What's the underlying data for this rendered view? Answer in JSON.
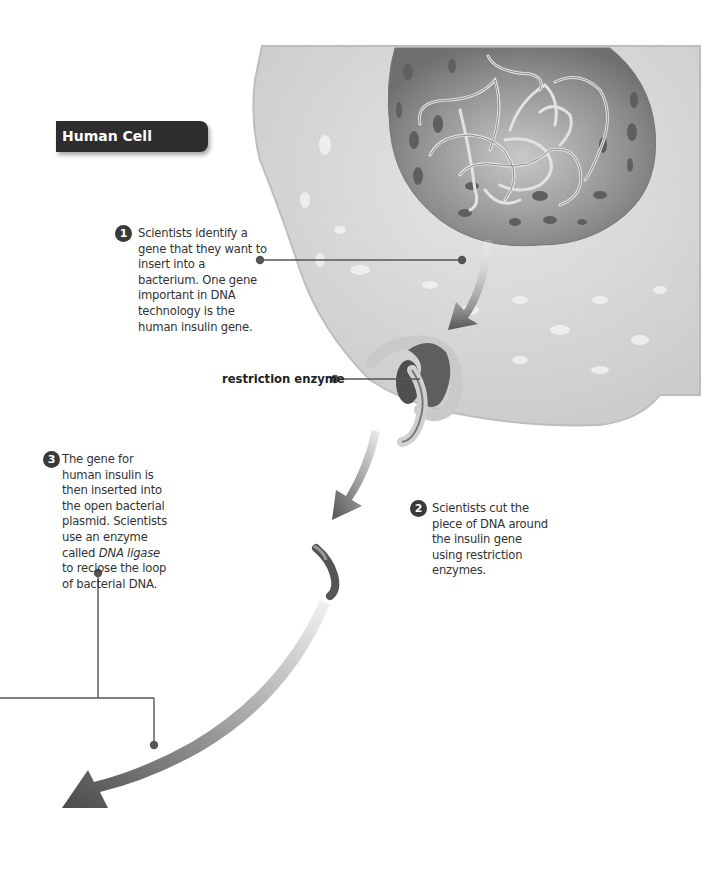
{
  "title": "Human Cell",
  "steps": [
    {
      "number": "1",
      "text": "Scientists identify a gene that they want to insert into a bacterium. One gene important in DNA technology is the human insulin gene."
    },
    {
      "number": "2",
      "text": "Scientists cut the piece of DNA around the insulin gene using restriction enzymes."
    },
    {
      "number": "3",
      "text_before": "The gene for human insulin is then inserted into the open bacterial plasmid. Scientists use an enzyme called ",
      "text_italic": "DNA ligase",
      "text_after": " to reclose the loop of bacterial DNA."
    }
  ],
  "labels": {
    "restriction_enzyme": "restriction enzyme"
  },
  "colors": {
    "title_bg": "#2d2d2d",
    "cell_fill": "#d9d9d9",
    "nucleus_fill": "#8a8a8a",
    "arrow": "#5a5a5a",
    "leader_line": "#555555"
  }
}
